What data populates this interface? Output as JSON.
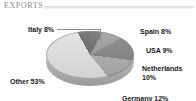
{
  "header": {
    "title": "EXPORTS"
  },
  "chart_data": {
    "type": "pie",
    "title": "EXPORTS",
    "categories": [
      "Italy",
      "Spain",
      "USA",
      "Netherlands",
      "Germany",
      "Other"
    ],
    "values": [
      8,
      9,
      10,
      12,
      53,
      8
    ],
    "unit": "%",
    "labels": [
      {
        "name": "Italy",
        "text": "Italy 8%",
        "value": 8,
        "color": "#5a5a5a"
      },
      {
        "name": "Spain",
        "text": "Spain 8%",
        "value": 8,
        "color": "#5f5f5f"
      },
      {
        "name": "USA",
        "text": "USA 9%",
        "value": 9,
        "color": "#949494"
      },
      {
        "name": "Netherlands",
        "text": "Netherlands 10%",
        "value": 10,
        "color": "#7b7b7b"
      },
      {
        "name": "Germany",
        "text": "Germany 12%",
        "value": 12,
        "color": "#a8a8a8"
      },
      {
        "name": "Other",
        "text": "Other 53%",
        "value": 53,
        "color": "#dedede"
      }
    ],
    "legend": "none",
    "style": "3d-pie",
    "palette": "grayscale"
  }
}
